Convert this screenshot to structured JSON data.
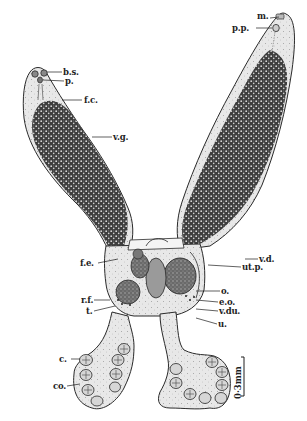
{
  "figure": {
    "type": "anatomical line drawing",
    "colors": {
      "background": "#ffffff",
      "outline": "#2a2a2a",
      "stipple_light": "#e6e6e6",
      "vitellaria_dark": "#3a3a3a",
      "label_text": "#1e1e1e"
    }
  },
  "labels": {
    "b_s": "b.s.",
    "p": "p.",
    "f_c": "f.c.",
    "v_g": "v.g.",
    "f_e": "f.e.",
    "r_f": "r.f.",
    "t": "t.",
    "c": "c.",
    "co": "co.",
    "m": "m.",
    "p_p": "p.p.",
    "v_d": "v.d.",
    "ut_p": "ut.p.",
    "o": "o.",
    "e_o": "e.o.",
    "v_du": "v.du.",
    "u": "u."
  },
  "scale_bar": {
    "label": "0·3mm"
  }
}
